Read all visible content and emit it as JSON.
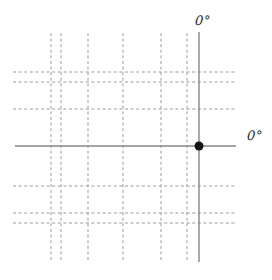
{
  "figure": {
    "name": "graticule-diagram",
    "background": "#ffffff",
    "labels": {
      "prime_meridian": "0°",
      "equator": "0°"
    },
    "colors": {
      "dashed_line": "#9b9b9b",
      "solid_line": "#878787",
      "point": "#151515",
      "label_text": "#2b2b2b"
    },
    "grid": {
      "dashed_vertical_x": [
        51,
        61,
        88,
        123,
        161,
        187
      ],
      "dashed_vertical_y_extent": [
        33,
        261
      ],
      "dashed_horizontal_y": [
        72,
        82,
        109,
        186,
        213,
        223
      ],
      "dashed_horizontal_x_extent": [
        13,
        237
      ],
      "solid_vertical_x": 199,
      "solid_vertical_y_extent": [
        32,
        262
      ],
      "solid_horizontal_y": 146,
      "solid_horizontal_x_extent": [
        15,
        236
      ],
      "dash_pattern": "3 2.6",
      "dashed_stroke_width": 1,
      "solid_stroke_width": 1.4,
      "point": {
        "x": 199,
        "y": 146,
        "radius": 4.5
      }
    }
  }
}
